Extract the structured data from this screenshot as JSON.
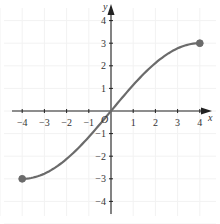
{
  "chart_data": {
    "type": "line",
    "title": "",
    "xlabel": "x",
    "ylabel": "y",
    "origin_label": "O",
    "xlim": [
      -4,
      4
    ],
    "ylim": [
      -4,
      4
    ],
    "xticks": [
      -4,
      -3,
      -2,
      -1,
      1,
      2,
      3,
      4
    ],
    "yticks": [
      -4,
      -3,
      -2,
      -1,
      1,
      2,
      3,
      4
    ],
    "xtick_labels": [
      "−4",
      "−3",
      "−2",
      "−1",
      "1",
      "2",
      "3",
      "4"
    ],
    "ytick_labels": [
      "−4",
      "−3",
      "−2",
      "−1",
      "1",
      "2",
      "3",
      "4"
    ],
    "grid": true,
    "legend": null,
    "series": [
      {
        "name": "f(x)",
        "description": "smooth increasing curve through origin, approx 3·sin(πx/8)",
        "x": [
          -4,
          -3,
          -2,
          -1,
          0,
          1,
          2,
          3,
          4
        ],
        "values": [
          -3,
          -2.77,
          -2.12,
          -1.15,
          0,
          1.15,
          2.12,
          2.77,
          3
        ],
        "endpoints": [
          {
            "x": -4,
            "y": -3,
            "marker": "closed"
          },
          {
            "x": 4,
            "y": 3,
            "marker": "closed"
          }
        ]
      }
    ],
    "colors": {
      "curve": "#6b6b6b",
      "axes": "#222222",
      "grid": "#f2f2f2",
      "text": "#333333"
    }
  }
}
